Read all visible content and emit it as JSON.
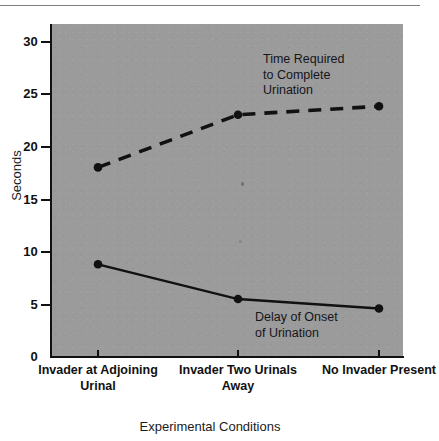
{
  "chart_data": {
    "type": "line",
    "title": "",
    "subtitle": "",
    "xlabel": "Experimental Conditions",
    "ylabel": "Seconds",
    "categories": [
      "Invader at\nAdjoining\nUrinal",
      "Invader\nTwo Urinals\nAway",
      "No Invader\nPresent"
    ],
    "category_labels_flat": [
      "Invader at Adjoining Urinal",
      "Invader Two Urinals Away",
      "No Invader Present"
    ],
    "ylim": [
      0,
      32
    ],
    "yticks": [
      0,
      5,
      10,
      15,
      20,
      25,
      30
    ],
    "ytick_labels": [
      "0",
      "5",
      "10",
      "15",
      "20",
      "25",
      "30"
    ],
    "grid": false,
    "legend_position": "inline-annotations",
    "series": [
      {
        "name": "Time Required to Complete Urination",
        "style": "dashed",
        "values": [
          18.0,
          23.0,
          23.8
        ]
      },
      {
        "name": "Delay of Onset of Urination",
        "style": "solid",
        "values": [
          8.8,
          5.5,
          4.6
        ]
      }
    ],
    "annotations": [
      {
        "text": "Time Required\nto Complete\nUrination",
        "series": "Time Required to Complete Urination"
      },
      {
        "text": "Delay of Onset\nof Urination",
        "series": "Delay of Onset of Urination"
      }
    ]
  },
  "colors": {
    "plot_background": "#9b9b9b",
    "ink": "#111111",
    "page_background": "#ffffff",
    "rule": "#7d7d7d"
  }
}
